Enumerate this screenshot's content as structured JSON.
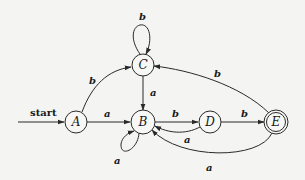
{
  "diagram": {
    "type": "finite-automaton",
    "start_label": "start",
    "states": [
      {
        "id": "A",
        "label": "A",
        "start": true,
        "accepting": false
      },
      {
        "id": "B",
        "label": "B",
        "start": false,
        "accepting": false
      },
      {
        "id": "C",
        "label": "C",
        "start": false,
        "accepting": false
      },
      {
        "id": "D",
        "label": "D",
        "start": false,
        "accepting": false
      },
      {
        "id": "E",
        "label": "E",
        "start": false,
        "accepting": true
      }
    ],
    "transitions": [
      {
        "from": "A",
        "to": "B",
        "label": "a"
      },
      {
        "from": "A",
        "to": "C",
        "label": "b"
      },
      {
        "from": "B",
        "to": "B",
        "label": "a"
      },
      {
        "from": "B",
        "to": "D",
        "label": "b"
      },
      {
        "from": "C",
        "to": "C",
        "label": "b"
      },
      {
        "from": "C",
        "to": "B",
        "label": "a"
      },
      {
        "from": "D",
        "to": "B",
        "label": "a"
      },
      {
        "from": "D",
        "to": "E",
        "label": "b"
      },
      {
        "from": "E",
        "to": "B",
        "label": "a"
      },
      {
        "from": "E",
        "to": "C",
        "label": "b"
      }
    ]
  }
}
